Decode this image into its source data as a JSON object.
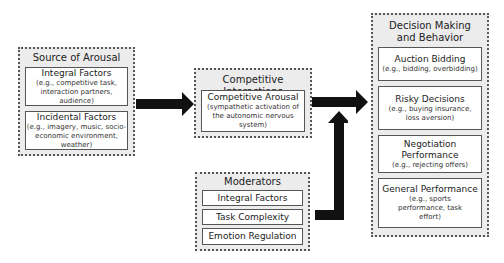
{
  "source": {
    "title": "Source of Arousal",
    "items": [
      {
        "title": "Integral Factors",
        "sub": "(e.g., competitive task, interaction partners, audience)"
      },
      {
        "title": "Incidental Factors",
        "sub": "(e.g., imagery, music, socio-economic environment, weather)"
      }
    ]
  },
  "competitive": {
    "title": "Competitive Interactions",
    "item": {
      "title": "Competitive Arousal",
      "sub": "(sympathetic activation of the autonomic nervous system)"
    }
  },
  "moderators": {
    "title": "Moderators",
    "items": [
      {
        "title": "Integral Factors"
      },
      {
        "title": "Task Complexity"
      },
      {
        "title": "Emotion Regulation"
      }
    ]
  },
  "decision": {
    "title": "Decision Making and Behavior",
    "items": [
      {
        "title": "Auction Bidding",
        "sub": "(e.g., bidding, overbidding)"
      },
      {
        "title": "Risky Decisions",
        "sub": "(e.g., buying insurance, loss aversion)"
      },
      {
        "title": "Negotiation Performance",
        "sub": "(e.g., rejecting offers)"
      },
      {
        "title": "General Performance",
        "sub": "(e.g., sports performance, task effort)"
      }
    ]
  },
  "colors": {
    "group_bg": "#ececec",
    "border": "#555555",
    "arrow": "#111111"
  }
}
